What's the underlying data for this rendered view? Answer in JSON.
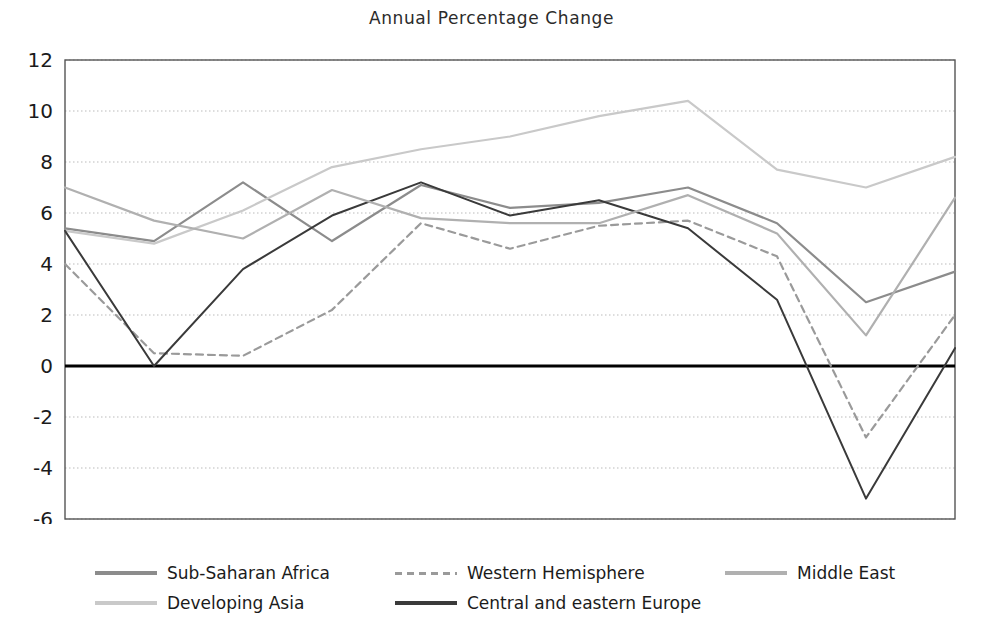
{
  "chart_data": {
    "type": "line",
    "title": "Annual Percentage Change",
    "xlabel": "",
    "ylabel": "",
    "x": [
      2000,
      2001,
      2002,
      2003,
      2004,
      2005,
      2006,
      2007,
      2008,
      2009,
      2010
    ],
    "xtick_labels": [
      "2000",
      "2002",
      "2004",
      "2006",
      "2008",
      "2010*"
    ],
    "xtick_values": [
      2000,
      2002,
      2004,
      2006,
      2008,
      2010
    ],
    "ytick_labels": [
      "-6",
      "-4",
      "-2",
      "0",
      "2",
      "4",
      "6",
      "8",
      "10",
      "12"
    ],
    "ytick_values": [
      -6,
      -4,
      -2,
      0,
      2,
      4,
      6,
      8,
      10,
      12
    ],
    "xlim": [
      2000,
      2010
    ],
    "ylim": [
      -6,
      12
    ],
    "grid": true,
    "legend_position": "bottom",
    "zero_line": 0,
    "series": [
      {
        "name": "Sub-Saharan Africa",
        "color": "#8c8c8c",
        "style": "solid",
        "values": [
          5.4,
          4.9,
          7.2,
          4.9,
          7.1,
          6.2,
          6.4,
          7.0,
          5.6,
          2.5,
          3.7
        ]
      },
      {
        "name": "Developing Asia",
        "color": "#c9c9c9",
        "style": "solid",
        "values": [
          5.3,
          4.8,
          6.1,
          7.8,
          8.5,
          9.0,
          9.8,
          10.4,
          7.7,
          7.0,
          8.2
        ]
      },
      {
        "name": "Western Hemisphere",
        "color": "#9a9a9a",
        "style": "dashed",
        "values": [
          4.0,
          0.5,
          0.4,
          2.2,
          5.6,
          4.6,
          5.5,
          5.7,
          4.3,
          -2.8,
          2.0
        ]
      },
      {
        "name": "Central and eastern Europe",
        "color": "#3a3a3a",
        "style": "solid",
        "values": [
          5.3,
          0.0,
          3.8,
          5.9,
          7.2,
          5.9,
          6.5,
          5.4,
          2.6,
          -5.2,
          0.7
        ]
      },
      {
        "name": "Middle East",
        "color": "#b0b0b0",
        "style": "solid",
        "values": [
          7.0,
          5.7,
          5.0,
          6.9,
          5.8,
          5.6,
          5.6,
          6.7,
          5.2,
          1.2,
          6.6
        ]
      }
    ]
  },
  "legend": {
    "items": [
      {
        "label": "Sub-Saharan Africa",
        "color": "#8c8c8c",
        "style": "solid"
      },
      {
        "label": "Western Hemisphere",
        "color": "#9a9a9a",
        "style": "dashed"
      },
      {
        "label": "Middle East",
        "color": "#b0b0b0",
        "style": "solid"
      },
      {
        "label": "Developing Asia",
        "color": "#c9c9c9",
        "style": "solid"
      },
      {
        "label": "Central and eastern Europe",
        "color": "#3a3a3a",
        "style": "solid"
      }
    ]
  },
  "colors": {
    "axis": "#555555",
    "grid": "#bbbbbb",
    "zero_line": "#000000",
    "text": "#1b1b1b"
  }
}
